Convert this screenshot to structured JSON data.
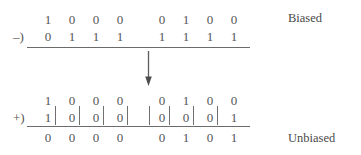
{
  "figure": {
    "title_hidden": "",
    "background_color": "#ffffff",
    "ink_color": "#545454"
  },
  "labels": {
    "biased": "Biased",
    "unbiased": "Unbiased"
  },
  "operators": {
    "subtract": "–)",
    "add": "+)"
  },
  "icons": {
    "down_arrow": "down-arrow-icon"
  },
  "top_block": {
    "minuend": {
      "left_group": [
        "1",
        "0",
        "0",
        "0"
      ],
      "right_group": [
        "0",
        "1",
        "0",
        "0"
      ]
    },
    "subtrahend": {
      "left_group": [
        "0",
        "1",
        "1",
        "1"
      ],
      "right_group": [
        "1",
        "1",
        "1",
        "1"
      ]
    }
  },
  "bottom_block": {
    "addend_one": {
      "left_group": [
        "1",
        "0",
        "0",
        "0"
      ],
      "right_group": [
        "0",
        "1",
        "0",
        "0"
      ]
    },
    "addend_two": {
      "left_group": [
        "1",
        "0",
        "0",
        "0"
      ],
      "right_group": [
        "0",
        "0",
        "0",
        "1"
      ]
    },
    "sum": {
      "left_group": [
        "0",
        "0",
        "0",
        "0"
      ],
      "right_group": [
        "0",
        "1",
        "0",
        "1"
      ]
    }
  }
}
